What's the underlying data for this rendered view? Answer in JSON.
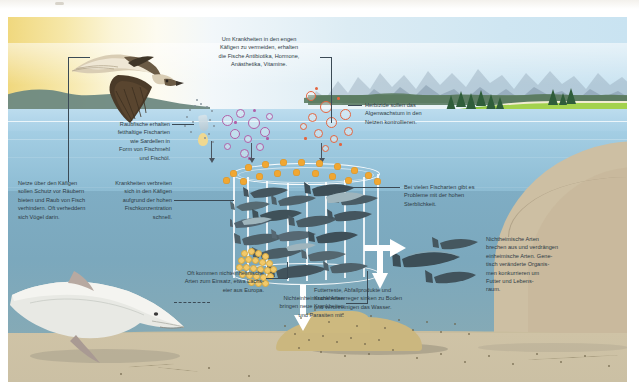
{
  "infographic": {
    "language": "de",
    "subject": "Aquakultur / Netzkaefige im Meer",
    "labels": {
      "drugs": "Um Krankheiten in den engen Käfigen zu vermeiden, erhalten die Fische Antibiotika, Hormone, Anästhetika, Vitamine.",
      "feed": "Raubfische erhalten fetthaltige Fischarten wie Sardellen in Form von Fischmehl und Fischöl.",
      "nets": "Netze über den Käfigen sollen Schutz vor Räubern bieten und Raub von Fisch verhindern. Oft verheddern sich Vögel darin.",
      "disease": "Krankheiten verbreiten sich in den Käfigen aufgrund der hohen Fischkonzentration schnell.",
      "herbicide": "Herbizide sollen das Algenwachstum in den Netzen kontrollieren.",
      "mortality": "Bei vielen Fischarten gibt es Probleme mit der hohen Sterblichkeit.",
      "escape": "Nichtheimische Arten brechen aus und verdrängen einheimische Arten. Genetisch veränderte Organismen konkurrieren um Futter und Lebensraum.",
      "nonnative_eggs": "Oft kommen nichteinheimische Arten zum Einsatz, etwa Lachseier aus Europa.",
      "nonnative_disease": "Nichteinheimische Arten bringen neue Krankheiten und Parasiten mit.",
      "waste": "Futterreste, Abfallprodukte und Krankheitserreger sinken zu Boden und verunreinigen das Wasser."
    },
    "label_lines": {
      "drugs": [
        "Um Krankheiten in den engen",
        "Käfigen zu vermeiden, erhalten",
        "die Fische Antibiotika, Hormone,",
        "Anästhetika, Vitamine."
      ],
      "feed": [
        "Raubfische erhalten",
        "fetthaltige Fischarten",
        "wie Sardellen in",
        "Form von Fischmehl",
        "und Fischöl."
      ],
      "nets": [
        "Netze über den Käfigen",
        "sollen Schutz vor Räubern",
        "bieten und Raub von Fisch",
        "verhindern. Oft verheddern",
        "sich Vögel darin."
      ],
      "disease": [
        "Krankheiten verbreiten",
        "sich in den Käfigen",
        "aufgrund der hohen",
        "Fischkonzentration",
        "schnell."
      ],
      "herbicide": [
        "Herbizide sollen das",
        "Algenwachstum in den",
        "Netzen kontrollieren."
      ],
      "mortality": [
        "Bei vielen Fischarten gibt es",
        "Probleme mit der hohen",
        "Sterblichkeit."
      ],
      "escape": [
        "Nichtheimische Arten",
        "brechen aus und verdrängen",
        "einheimische Arten. Gene-",
        "tisch veränderte Organis-",
        "men konkurrieren um",
        "Futter und Lebens-",
        "raum."
      ],
      "nonnative_eggs": [
        "Oft kommen nichteinheimische",
        "Arten zum Einsatz, etwa Lachs-",
        "eier aus Europa."
      ],
      "nonnative_disease": [
        "Nichteinheimische Arten",
        "bringen neue Krankheiten",
        "und Parasiten mit."
      ],
      "waste": [
        "Futterreste, Abfallprodukte und",
        "Krankheitserreger sinken zu Boden",
        "und verunreinigen das Wasser."
      ]
    },
    "scene_elements": {
      "bird": "osprey-flying",
      "marine_mammal": "beluga-whale",
      "cage": "net-cage",
      "escaped_fish": "escaped-fish-group",
      "waste_mound": "sediment-mound",
      "feed_pellets": "fish-eggs-cluster"
    },
    "colors": {
      "sky_warm": "#f0d87e",
      "sky_cool": "#c9e3f1",
      "sea_surface": "#bcdcee",
      "sea_deep": "#7ba8bd",
      "seabed": "#cbc0a4",
      "grass": "#8cc63f",
      "treeline": "#2f5d3a",
      "float_orange": "#f0a732",
      "drug_magenta": "#b05fa8",
      "herbicide_orange": "#e3653f",
      "pellet_yellow": "#f2c96a",
      "text": "#2d3a44",
      "leader": "#3b4a55",
      "arrow_white": "#ffffff"
    }
  }
}
